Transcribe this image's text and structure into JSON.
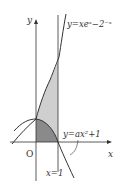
{
  "diagram": {
    "axes": {
      "x_label": "x",
      "y_label": "y",
      "origin_label": "O"
    },
    "curves": [
      {
        "name": "exponential-curve",
        "label": "y=xeˣ−2⁻ˣ"
      },
      {
        "name": "parabola",
        "label": "y=ax²+1"
      }
    ],
    "vertical_line": {
      "label": "x=1"
    },
    "regions": [
      {
        "name": "light-shaded-region",
        "description": "between exponential curve and parabola, 0≤x≤1",
        "color": "#cfcfcf"
      },
      {
        "name": "dark-shaded-region",
        "description": "under parabola above x-axis, 0≤x≤1",
        "color": "#8a8a8a"
      }
    ],
    "colors": {
      "line": "#333333",
      "light_fill": "#cfcfcf",
      "dark_fill": "#8a8a8a"
    }
  }
}
